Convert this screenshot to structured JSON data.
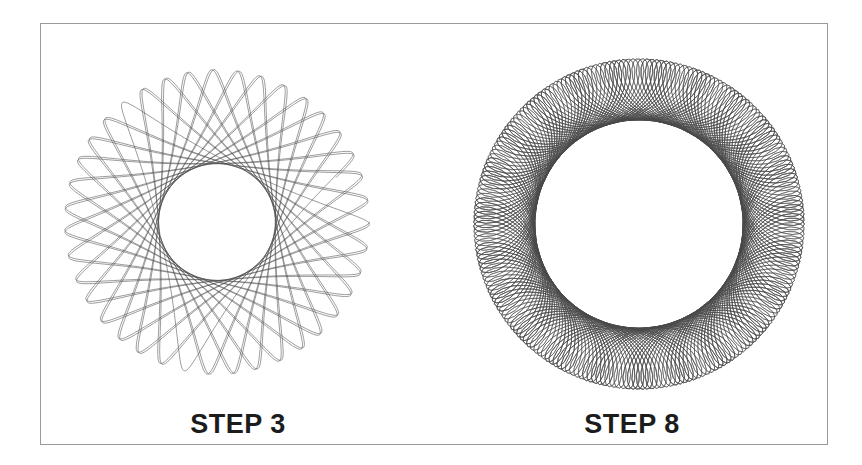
{
  "page": {
    "background_color": "#ffffff",
    "frame_border_color": "#9a9a9a",
    "stroke_color": "#4a4a4a",
    "text_color": "#1c1c1c"
  },
  "figures": [
    {
      "id": "step-3",
      "caption": "STEP 3",
      "pattern_type": "hypotrochoid-spirograph",
      "outer_radius_px": 166,
      "inner_hole_radius_px": 70,
      "lobes": 27,
      "params": {
        "R": 166,
        "r": 59.6,
        "d": 47.5,
        "turns": 27
      }
    },
    {
      "id": "step-8",
      "caption": "STEP 8",
      "pattern_type": "hypotrochoid-spirograph",
      "outer_radius_px": 172,
      "inner_hole_radius_px": 99,
      "lobes": 72,
      "params": {
        "R": 172,
        "r": 22.4,
        "d": 34.2,
        "turns": 72
      }
    }
  ],
  "chart_data": {
    "type": "line",
    "title": "",
    "xlabel": "",
    "ylabel": "",
    "categories": [
      "STEP 3",
      "STEP 8"
    ],
    "series": [
      {
        "name": "STEP 3",
        "lobes": 27,
        "outer_radius": 166,
        "inner_radius": 70
      },
      {
        "name": "STEP 8",
        "lobes": 72,
        "outer_radius": 172,
        "inner_radius": 99
      }
    ]
  }
}
